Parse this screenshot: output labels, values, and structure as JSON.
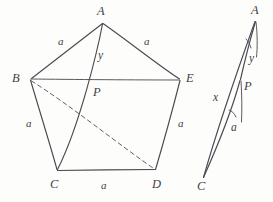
{
  "figure": {
    "background_color": "#fdfdfc",
    "ink_color": "#4a4a52",
    "canvas": {
      "width": 273,
      "height": 202
    }
  },
  "pentagon": {
    "name": "ABCDE",
    "vertices": [
      {
        "id": "A",
        "label": "A",
        "x": 102,
        "y": 22,
        "label_x": 97,
        "label_y": 5
      },
      {
        "id": "B",
        "label": "B",
        "x": 30,
        "y": 79,
        "label_x": 12,
        "label_y": 72
      },
      {
        "id": "C",
        "label": "C",
        "x": 57,
        "y": 170,
        "label_x": 50,
        "label_y": 178
      },
      {
        "id": "D",
        "label": "D",
        "x": 155,
        "y": 170,
        "label_x": 152,
        "label_y": 178
      },
      {
        "id": "E",
        "label": "E",
        "x": 180,
        "y": 80,
        "label_x": 186,
        "label_y": 72
      }
    ],
    "interior_point": {
      "id": "P",
      "label": "P",
      "x": 90,
      "y": 85,
      "label_x": 93,
      "label_y": 86
    },
    "side_labels": [
      {
        "text": "a",
        "edge": "AB",
        "x": 58,
        "y": 36
      },
      {
        "text": "a",
        "edge": "AE",
        "x": 144,
        "y": 36
      },
      {
        "text": "a",
        "edge": "BC",
        "x": 26,
        "y": 118
      },
      {
        "text": "a",
        "edge": "DE",
        "x": 178,
        "y": 118
      },
      {
        "text": "a",
        "edge": "CD",
        "x": 101,
        "y": 180
      }
    ],
    "segment_labels": [
      {
        "text": "y",
        "segment": "AP",
        "x": 98,
        "y": 50
      }
    ],
    "solid_edges": [
      "AB",
      "BC",
      "CD",
      "DE",
      "EA",
      "BE"
    ],
    "solid_diagonals": [
      "AC"
    ],
    "dashed_diagonals": [
      "BD"
    ]
  },
  "detached_triangle": {
    "name": "APC",
    "vertices": [
      {
        "id": "A2",
        "label": "A",
        "x": 255,
        "y": 20,
        "label_x": 251,
        "label_y": 4
      },
      {
        "id": "P2",
        "label": "P",
        "x": 240,
        "y": 80,
        "label_x": 244,
        "label_y": 80
      },
      {
        "id": "C2",
        "label": "C",
        "x": 203,
        "y": 178,
        "label_x": 197,
        "label_y": 180
      }
    ],
    "segment_labels": [
      {
        "text": "y",
        "segment": "AP",
        "x": 249,
        "y": 53
      },
      {
        "text": "x",
        "segment": "AC",
        "x": 213,
        "y": 92
      },
      {
        "text": "a",
        "segment": "PC",
        "x": 231,
        "y": 122
      }
    ]
  }
}
